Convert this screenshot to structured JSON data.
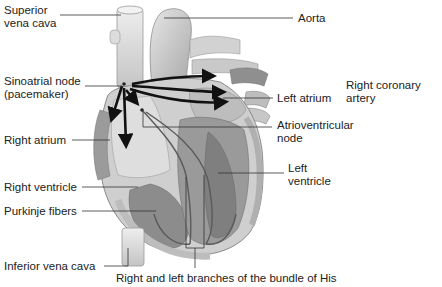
{
  "diagram": {
    "labels": {
      "superior_vena_cava": [
        "Superior",
        "vena cava"
      ],
      "aorta": "Aorta",
      "sinoatrial_node": [
        "Sinoatrial node",
        "(pacemaker)"
      ],
      "left_atrium": "Left atrium",
      "right_coronary_artery": [
        "Right coronary",
        "artery"
      ],
      "atrioventricular_node": [
        "Atrioventricular",
        "node"
      ],
      "right_atrium": "Right atrium",
      "left_ventricle": [
        "Left",
        "ventricle"
      ],
      "right_ventricle": "Right ventricle",
      "purkinje_fibers": "Purkinje fibers",
      "inferior_vena_cava": "Inferior vena cava",
      "bundle_of_his": "Right and left branches of the bundle of His"
    },
    "colors": {
      "background": "#ffffff",
      "heart_light": "#d9d9d9",
      "heart_mid": "#b8b8b8",
      "heart_dark": "#8c8c8c",
      "arrow": "#111111",
      "leader": "#333333"
    }
  }
}
